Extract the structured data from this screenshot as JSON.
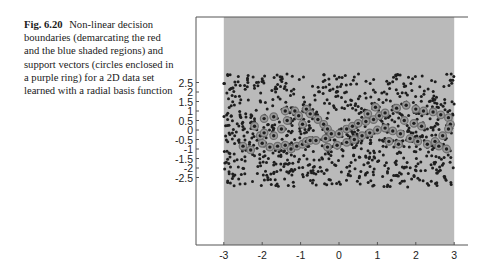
{
  "caption": {
    "label": "Fig. 6.20",
    "text": "Non-linear decision boundaries (demarcating the red and the blue shaded regions) and support vectors (circles enclosed in a purple ring) for a 2D data set learned with a radial basis function"
  },
  "colors": {
    "background": "#ffffff",
    "shaded_region": "#bababa",
    "point": "#1e1e1e",
    "support_vector_ring": "#6e6e6e",
    "axis": "#555555"
  },
  "chart_data": {
    "type": "scatter",
    "title": "",
    "xlabel": "",
    "ylabel": "",
    "xlim": [
      -3.6,
      3.4
    ],
    "ylim": [
      -3.0,
      2.95
    ],
    "grid": false,
    "legend": null,
    "x_ticks": [
      -3,
      -2,
      -1,
      0,
      1,
      2,
      3
    ],
    "x_tick_labels": [
      "-3",
      "-2",
      "-1",
      "0",
      "1",
      "2",
      "3"
    ],
    "y_ticks": [
      2.5,
      2,
      1.5,
      1,
      0.5,
      0,
      -0.5,
      -1,
      -1.5,
      -2,
      -2.5
    ],
    "y_tick_labels": [
      "2.5",
      "2",
      "1.5",
      "1",
      "0.5",
      "0",
      "-0.5",
      "-1",
      "-1.5",
      "-2",
      "-2.5"
    ],
    "shaded_region": {
      "x": [
        -3,
        3
      ],
      "y": [
        -3.0,
        2.95
      ]
    },
    "series": [
      {
        "name": "data points",
        "marker": "dot",
        "count_approx": 900,
        "distribution": "uniform over [-3,3] x [-3,3]",
        "generator_seed": 6
      },
      {
        "name": "support vectors",
        "marker": "ringed dot",
        "points": [
          [
            -2.2,
            0.2
          ],
          [
            -2.05,
            -0.3
          ],
          [
            -1.95,
            -0.15
          ],
          [
            -2.0,
            -0.7
          ],
          [
            -1.8,
            -0.9
          ],
          [
            -1.6,
            -0.85
          ],
          [
            -1.4,
            -0.8
          ],
          [
            -1.25,
            -1.0
          ],
          [
            -1.1,
            -0.85
          ],
          [
            -0.95,
            -0.75
          ],
          [
            -0.85,
            -0.6
          ],
          [
            -0.75,
            -0.55
          ],
          [
            -1.95,
            0.6
          ],
          [
            -1.7,
            0.7
          ],
          [
            -1.4,
            1.0
          ],
          [
            -1.15,
            1.0
          ],
          [
            -1.05,
            0.75
          ],
          [
            -1.35,
            0.5
          ],
          [
            -0.85,
            1.1
          ],
          [
            -0.75,
            0.85
          ],
          [
            -0.55,
            0.55
          ],
          [
            -0.4,
            0.3
          ],
          [
            -0.3,
            0.05
          ],
          [
            -0.2,
            -0.2
          ],
          [
            -2.5,
            -0.85
          ],
          [
            -2.3,
            -1.05
          ],
          [
            -0.6,
            -0.55
          ],
          [
            -0.35,
            -0.45
          ],
          [
            0.0,
            -0.2
          ],
          [
            0.2,
            0.05
          ],
          [
            0.35,
            0.2
          ],
          [
            0.5,
            0.35
          ],
          [
            0.7,
            0.45
          ],
          [
            0.9,
            0.55
          ],
          [
            1.05,
            0.75
          ],
          [
            1.2,
            0.9
          ],
          [
            1.5,
            1.15
          ],
          [
            1.75,
            1.3
          ],
          [
            2.0,
            1.1
          ],
          [
            2.2,
            1.0
          ],
          [
            2.45,
            0.95
          ],
          [
            2.65,
            0.8
          ],
          [
            2.85,
            0.65
          ],
          [
            2.9,
            0.3
          ],
          [
            2.85,
            0.05
          ],
          [
            2.7,
            -0.3
          ],
          [
            2.5,
            -0.6
          ],
          [
            2.3,
            -0.75
          ],
          [
            2.05,
            -0.6
          ],
          [
            1.85,
            -0.45
          ],
          [
            1.6,
            -0.2
          ],
          [
            1.4,
            -0.05
          ],
          [
            1.2,
            0.1
          ],
          [
            1.0,
            0.0
          ],
          [
            0.8,
            -0.15
          ],
          [
            0.6,
            -0.3
          ],
          [
            0.4,
            -0.5
          ],
          [
            0.2,
            -0.65
          ],
          [
            -0.05,
            -0.8
          ],
          [
            -0.3,
            -0.9
          ],
          [
            1.3,
            -0.6
          ],
          [
            1.55,
            -0.75
          ],
          [
            2.6,
            -0.85
          ],
          [
            2.8,
            -1.0
          ],
          [
            0.75,
            0.85
          ],
          [
            0.95,
            1.2
          ],
          [
            1.7,
            0.5
          ],
          [
            1.95,
            0.35
          ],
          [
            2.15,
            0.2
          ],
          [
            -1.5,
            0.05
          ],
          [
            -1.7,
            -0.3
          ],
          [
            -0.95,
            0.3
          ]
        ]
      }
    ]
  }
}
